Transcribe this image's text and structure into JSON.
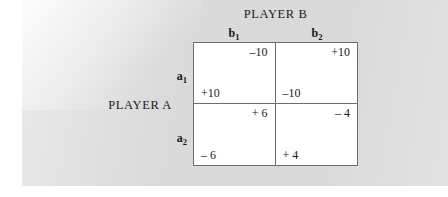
{
  "figure": {
    "column_player_title": "PLAYER B",
    "row_player_title": "PLAYER A",
    "column_headers": [
      {
        "base": "b",
        "subscript": "1"
      },
      {
        "base": "b",
        "subscript": "2"
      }
    ],
    "row_headers": [
      {
        "base": "a",
        "subscript": "1"
      },
      {
        "base": "a",
        "subscript": "2"
      }
    ],
    "cells": [
      {
        "row": "a1",
        "col": "b1",
        "column_player_payoff": "–10",
        "row_player_payoff": "+10"
      },
      {
        "row": "a1",
        "col": "b2",
        "column_player_payoff": "+10",
        "row_player_payoff": "–10"
      },
      {
        "row": "a2",
        "col": "b1",
        "column_player_payoff": "+ 6",
        "row_player_payoff": "– 6"
      },
      {
        "row": "a2",
        "col": "b2",
        "column_player_payoff": "– 4",
        "row_player_payoff": "+ 4"
      }
    ]
  },
  "chart_data": {
    "type": "table",
    "xlabel": "PLAYER B",
    "ylabel": "PLAYER A",
    "categories": [
      "b1",
      "b2"
    ],
    "row_categories": [
      "a1",
      "a2"
    ],
    "cell_payoffs": [
      [
        {
          "row_player": 10,
          "column_player": -10
        },
        {
          "row_player": -10,
          "column_player": 10
        }
      ],
      [
        {
          "row_player": -6,
          "column_player": 6
        },
        {
          "row_player": 4,
          "column_player": -4
        }
      ]
    ]
  },
  "colors": {
    "page_background": "#dcdcdc",
    "matrix_background": "#ffffff",
    "grid_line": "#6e6e6e",
    "text": "#1a1a1a"
  }
}
